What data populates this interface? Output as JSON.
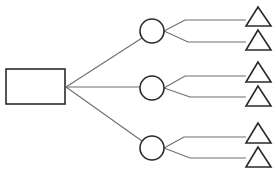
{
  "diagram": {
    "type": "tree",
    "colors": {
      "background": "#ffffff",
      "shape_stroke": "#2a2a2a",
      "connector_stroke": "#6e6e6e"
    },
    "root": {
      "shape": "rectangle",
      "x": 6,
      "y": 69,
      "width": 59,
      "height": 35,
      "label": ""
    },
    "junction": {
      "x": 66,
      "y": 87
    },
    "branches": [
      {
        "circle": {
          "cx": 152,
          "cy": 31,
          "r": 12,
          "label": ""
        },
        "root_edge_end": {
          "x": 142,
          "y": 38
        },
        "leaves": [
          {
            "elbow": {
              "x": 185,
              "y": 20
            },
            "line_end_x": 246,
            "triangle": {
              "apex": [
                258,
                7
              ],
              "base_left": [
                246,
                26
              ],
              "base_right": [
                271,
                26
              ]
            },
            "label": ""
          },
          {
            "elbow": {
              "x": 188,
              "y": 42
            },
            "line_end_x": 246,
            "triangle": {
              "apex": [
                258,
                30
              ],
              "base_left": [
                246,
                50
              ],
              "base_right": [
                271,
                50
              ]
            },
            "label": ""
          }
        ]
      },
      {
        "circle": {
          "cx": 152,
          "cy": 88,
          "r": 12,
          "label": ""
        },
        "root_edge_end": {
          "x": 140,
          "y": 87
        },
        "leaves": [
          {
            "elbow": {
              "x": 185,
              "y": 76
            },
            "line_end_x": 246,
            "triangle": {
              "apex": [
                258,
                62
              ],
              "base_left": [
                246,
                82
              ],
              "base_right": [
                271,
                82
              ]
            },
            "label": ""
          },
          {
            "elbow": {
              "x": 190,
              "y": 97
            },
            "line_end_x": 246,
            "triangle": {
              "apex": [
                258,
                86
              ],
              "base_left": [
                246,
                106
              ],
              "base_right": [
                271,
                106
              ]
            },
            "label": ""
          }
        ]
      },
      {
        "circle": {
          "cx": 152,
          "cy": 148,
          "r": 12,
          "label": ""
        },
        "root_edge_end": {
          "x": 142,
          "y": 141
        },
        "leaves": [
          {
            "elbow": {
              "x": 184,
              "y": 137
            },
            "line_end_x": 246,
            "triangle": {
              "apex": [
                258,
                123
              ],
              "base_left": [
                246,
                143
              ],
              "base_right": [
                271,
                143
              ]
            },
            "label": ""
          },
          {
            "elbow": {
              "x": 190,
              "y": 158
            },
            "line_end_x": 246,
            "triangle": {
              "apex": [
                258,
                147
              ],
              "base_left": [
                246,
                167
              ],
              "base_right": [
                271,
                167
              ]
            },
            "label": ""
          }
        ]
      }
    ]
  }
}
